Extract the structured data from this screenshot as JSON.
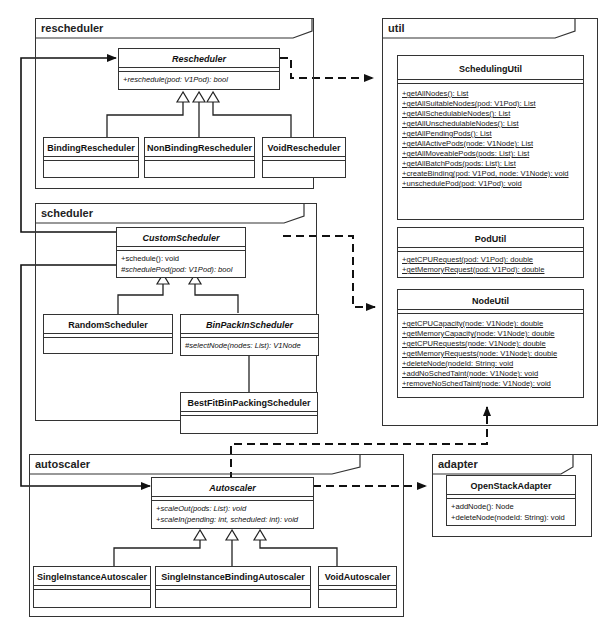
{
  "packages": {
    "rescheduler": {
      "name": "rescheduler"
    },
    "scheduler": {
      "name": "scheduler"
    },
    "autoscaler": {
      "name": "autoscaler"
    },
    "util": {
      "name": "util"
    },
    "adapter": {
      "name": "adapter"
    }
  },
  "classes": {
    "rescheduler": {
      "name": "Rescheduler",
      "abstract": true,
      "ops": [
        "+reschedule(pod: V1Pod): bool"
      ]
    },
    "binding_rescheduler": {
      "name": "BindingRescheduler"
    },
    "nonbinding_rescheduler": {
      "name": "NonBindingRescheduler"
    },
    "void_rescheduler": {
      "name": "VoidRescheduler"
    },
    "custom_scheduler": {
      "name": "CustomScheduler",
      "abstract": true,
      "ops": [
        "+schedule(): void",
        "#schedulePod(pod: V1Pod): bool"
      ]
    },
    "random_scheduler": {
      "name": "RandomScheduler"
    },
    "binpack_scheduler": {
      "name": "BinPackInScheduler",
      "abstract": true,
      "ops": [
        "#selectNode(nodes: List): V1Node"
      ]
    },
    "bestfit_scheduler": {
      "name": "BestFitBinPackingScheduler"
    },
    "autoscaler": {
      "name": "Autoscaler",
      "abstract": true,
      "ops": [
        "+scaleOut(pods: List): void",
        "+scaleIn(pending: int, scheduled: int): void"
      ]
    },
    "single_autoscaler": {
      "name": "SingleInstanceAutoscaler"
    },
    "single_binding_autoscaler": {
      "name": "SingleInstanceBindingAutoscaler"
    },
    "void_autoscaler": {
      "name": "VoidAutoscaler"
    },
    "scheduling_util": {
      "name": "SchedulingUtil",
      "ops": [
        "+getAllNodes(): List",
        "+getAllSuitableNodes(pod: V1Pod): List",
        "+getAllSchedulableNodes(): List",
        "+getAllUnschedulableNodes(): List",
        "+getAllPendingPods(): List",
        "+getAllActivePods(node: V1Node): List",
        "+getAllMoveablePods(pods: List): List",
        "+getAllBatchPods(pods: List): List",
        "+createBinding(pod: V1Pod, node: V1Node): void",
        "+unschedulePod(pod: V1Pod): void"
      ]
    },
    "pod_util": {
      "name": "PodUtil",
      "ops": [
        "+getCPURequest(pod: V1Pod): double",
        "+getMemoryRequest(pod: V1Pod): double"
      ]
    },
    "node_util": {
      "name": "NodeUtil",
      "ops": [
        "+getCPUCapacity(node: V1Node): double",
        "+getMemoryCapacity(node: V1Node): double",
        "+getCPURequests(node: V1Node): double",
        "+getMemoryRequests(node: V1Node): double",
        "+deleteNode(nodeId: String: void",
        "+addNoSchedTaint(node: V1Node): void",
        "+removeNoSchedTaint(node: V1Node): void"
      ]
    },
    "openstack_adapter": {
      "name": "OpenStackAdapter",
      "ops": [
        "+addNode(): Node",
        "+deleteNode(nodeId: String): void"
      ]
    }
  },
  "relations": [
    {
      "type": "generalization",
      "from": "BindingRescheduler",
      "to": "Rescheduler"
    },
    {
      "type": "generalization",
      "from": "NonBindingRescheduler",
      "to": "Rescheduler"
    },
    {
      "type": "generalization",
      "from": "VoidRescheduler",
      "to": "Rescheduler"
    },
    {
      "type": "generalization",
      "from": "RandomScheduler",
      "to": "CustomScheduler"
    },
    {
      "type": "generalization",
      "from": "BinPackInScheduler",
      "to": "CustomScheduler"
    },
    {
      "type": "generalization",
      "from": "BestFitBinPackingScheduler",
      "to": "BinPackInScheduler"
    },
    {
      "type": "generalization",
      "from": "SingleInstanceAutoscaler",
      "to": "Autoscaler"
    },
    {
      "type": "generalization",
      "from": "SingleInstanceBindingAutoscaler",
      "to": "Autoscaler"
    },
    {
      "type": "generalization",
      "from": "VoidAutoscaler",
      "to": "Autoscaler"
    },
    {
      "type": "association",
      "from": "CustomScheduler",
      "to": "Rescheduler"
    },
    {
      "type": "association",
      "from": "CustomScheduler",
      "to": "Autoscaler"
    },
    {
      "type": "dependency",
      "from": "Rescheduler",
      "to": "util"
    },
    {
      "type": "dependency",
      "from": "CustomScheduler",
      "to": "util"
    },
    {
      "type": "dependency",
      "from": "Autoscaler",
      "to": "util"
    },
    {
      "type": "dependency",
      "from": "Autoscaler",
      "to": "OpenStackAdapter"
    }
  ]
}
